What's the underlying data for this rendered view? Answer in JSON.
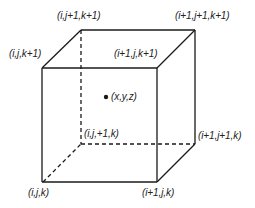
{
  "diagram": {
    "type": "cube-grid-cell",
    "vertices": {
      "i_j_k": {
        "label": "(i,j,k)",
        "x": 43,
        "y": 182
      },
      "i1_j_k": {
        "label": "(i+1,j,k)",
        "x": 157,
        "y": 182
      },
      "i_j1_k": {
        "label": "(i,j,+1,k)",
        "x": 81,
        "y": 144
      },
      "i1_j1_k": {
        "label": "(i+1,j+1,k)",
        "x": 195,
        "y": 144
      },
      "i_j_k1": {
        "label": "(i,j,k+1)",
        "x": 42,
        "y": 68
      },
      "i1_j_k1": {
        "label": "(i+1,j,k+1)",
        "x": 157,
        "y": 68
      },
      "i_j1_k1": {
        "label": "(i,j+1,k+1)",
        "x": 81,
        "y": 30
      },
      "i1_j1_k1": {
        "label": "(i+1,j+1,k+1)",
        "x": 194,
        "y": 30
      }
    },
    "center_point": {
      "label": "(x,y,z)",
      "x": 106,
      "y": 97
    },
    "hidden_edges_style": "dashed",
    "visible_edges_style": "solid",
    "line_color": "#1a1a1a",
    "text_color": "#222222"
  }
}
